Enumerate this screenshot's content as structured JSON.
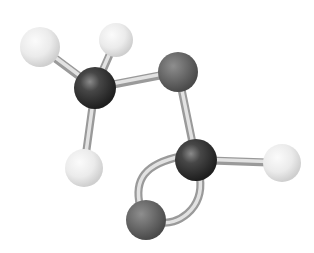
{
  "figure": {
    "molecule": "methyl formate",
    "formula": "HCOOCH3",
    "colors": {
      "background": "#ffffff",
      "carbon": "#3a3a3a",
      "oxygen": "#6a6a6a",
      "hydrogen": "#ececec",
      "bond": "#c8c8c8"
    },
    "atoms": [
      {
        "id": "H1",
        "element": "H",
        "cx": 40,
        "cy": 47,
        "r": 20
      },
      {
        "id": "H2",
        "element": "H",
        "cx": 116,
        "cy": 40,
        "r": 17
      },
      {
        "id": "C1",
        "element": "C",
        "cx": 95,
        "cy": 88,
        "r": 21
      },
      {
        "id": "O1",
        "element": "O",
        "cx": 178,
        "cy": 72,
        "r": 20
      },
      {
        "id": "H4",
        "element": "H",
        "cx": 84,
        "cy": 168,
        "r": 19
      },
      {
        "id": "C2",
        "element": "C",
        "cx": 196,
        "cy": 160,
        "r": 21
      },
      {
        "id": "H3",
        "element": "H",
        "cx": 282,
        "cy": 163,
        "r": 19
      },
      {
        "id": "O2",
        "element": "O",
        "cx": 146,
        "cy": 220,
        "r": 20
      }
    ],
    "bonds": [
      {
        "from": "C1",
        "to": "H1",
        "type": "single"
      },
      {
        "from": "C1",
        "to": "H2",
        "type": "single"
      },
      {
        "from": "C1",
        "to": "H4",
        "type": "single"
      },
      {
        "from": "C1",
        "to": "O1",
        "type": "single"
      },
      {
        "from": "O1",
        "to": "C2",
        "type": "single"
      },
      {
        "from": "C2",
        "to": "H3",
        "type": "single"
      },
      {
        "from": "C2",
        "to": "O2",
        "type": "double"
      }
    ]
  }
}
